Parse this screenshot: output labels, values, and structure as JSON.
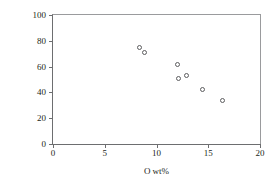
{
  "chart_data": {
    "type": "scatter",
    "title": "",
    "xlabel": "O wt%",
    "ylabel": "βSiC wt%",
    "xlim": [
      0,
      20
    ],
    "ylim": [
      0,
      100
    ],
    "xticks": [
      0,
      5,
      10,
      15,
      20
    ],
    "yticks": [
      0,
      20,
      40,
      60,
      80,
      100
    ],
    "xtick_labels": [
      "0",
      "5",
      "10",
      "15",
      "20"
    ],
    "ytick_labels": [
      "0",
      "20",
      "40",
      "60",
      "80",
      "100"
    ],
    "grid": false,
    "legend": null,
    "marker": "open-circle",
    "marker_color": "#5c5d5f",
    "series": [
      {
        "name": "βSiC vs O",
        "points": [
          {
            "x": 8.4,
            "y": 75
          },
          {
            "x": 8.8,
            "y": 71
          },
          {
            "x": 12.0,
            "y": 62
          },
          {
            "x": 12.1,
            "y": 51
          },
          {
            "x": 12.9,
            "y": 53
          },
          {
            "x": 14.4,
            "y": 42
          },
          {
            "x": 16.4,
            "y": 34
          }
        ]
      }
    ]
  }
}
